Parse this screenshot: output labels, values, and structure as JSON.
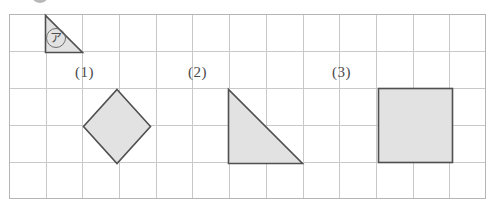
{
  "figure": {
    "grid": {
      "columns": 13,
      "rows": 5,
      "cell_width": 36.7,
      "cell_height": 37,
      "line_color": "#c9c9c9",
      "border_color": "#b5b5b5",
      "background": "#ffffff"
    },
    "colors": {
      "shape_fill": "#e2e2e2",
      "shape_stroke": "#4f4f4f",
      "label_text": "#4a4a4a",
      "marker_stroke": "#6e6e6e"
    },
    "sample": {
      "name": "reference-triangle",
      "marker_label": "ア",
      "shape_type": "right-triangle",
      "description": "small shaded right triangle, right angle at bottom-left"
    },
    "shapes": [
      {
        "id": "shape-1",
        "label": "(1)",
        "shape_type": "diamond",
        "description": "shaded square rotated 45 degrees",
        "grid_span": "2 x 2"
      },
      {
        "id": "shape-2",
        "label": "(2)",
        "shape_type": "right-triangle",
        "description": "shaded right triangle, right angle at bottom-left",
        "grid_span": "2 x 2"
      },
      {
        "id": "shape-3",
        "label": "(3)",
        "shape_type": "square",
        "description": "shaded square aligned to grid",
        "grid_span": "2 x 2"
      }
    ]
  }
}
